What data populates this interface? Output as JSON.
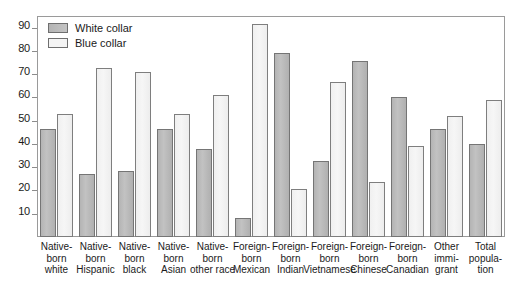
{
  "chart_data": {
    "type": "bar",
    "title": "",
    "subtitle": "",
    "xlabel": "",
    "ylabel": "",
    "ylim": [
      0,
      95
    ],
    "y_ticks": [
      10,
      20,
      30,
      40,
      50,
      60,
      70,
      80,
      90
    ],
    "grid": false,
    "legend_position": "top-left",
    "categories": [
      "Native-born white",
      "Native-born Hispanic",
      "Native-born black",
      "Native-born Asian",
      "Native-born other race",
      "Foreign-born Mexican",
      "Foreign-born Indian",
      "Foreign-born Vietnamese",
      "Foreign-born Chinese",
      "Foreign-born Canadian",
      "Other immigrant",
      "Total population"
    ],
    "category_label_lines": [
      [
        "Native-",
        "born",
        "white"
      ],
      [
        "Native-",
        "born",
        "Hispanic"
      ],
      [
        "Native-",
        "born",
        "black"
      ],
      [
        "Native-",
        "born",
        "Asian"
      ],
      [
        "Native-",
        "born",
        "other race"
      ],
      [
        "Foreign-",
        "born",
        "Mexican"
      ],
      [
        "Foreign-",
        "born",
        "Indian"
      ],
      [
        "Foreign-",
        "born",
        "Vietnamese"
      ],
      [
        "Foreign-",
        "born",
        "Chinese"
      ],
      [
        "Foreign-",
        "born",
        "Canadian"
      ],
      [
        "Other",
        "immi-",
        "grant"
      ],
      [
        "Total",
        "popula-",
        "tion"
      ]
    ],
    "series": [
      {
        "name": "White collar",
        "color": "#bdbdbd",
        "values": [
          46.5,
          27.0,
          28.5,
          46.5,
          38.0,
          8.0,
          79.0,
          32.5,
          75.5,
          60.0,
          46.5,
          40.0
        ]
      },
      {
        "name": "Blue collar",
        "color": "#f2f2f2",
        "values": [
          53.0,
          72.5,
          71.0,
          53.0,
          61.0,
          91.5,
          20.5,
          66.5,
          23.5,
          39.0,
          52.0,
          59.0
        ]
      }
    ]
  },
  "legend": {
    "items": [
      {
        "label": "White collar",
        "swatch": "white-collar"
      },
      {
        "label": "Blue collar",
        "swatch": "blue-collar"
      }
    ]
  }
}
